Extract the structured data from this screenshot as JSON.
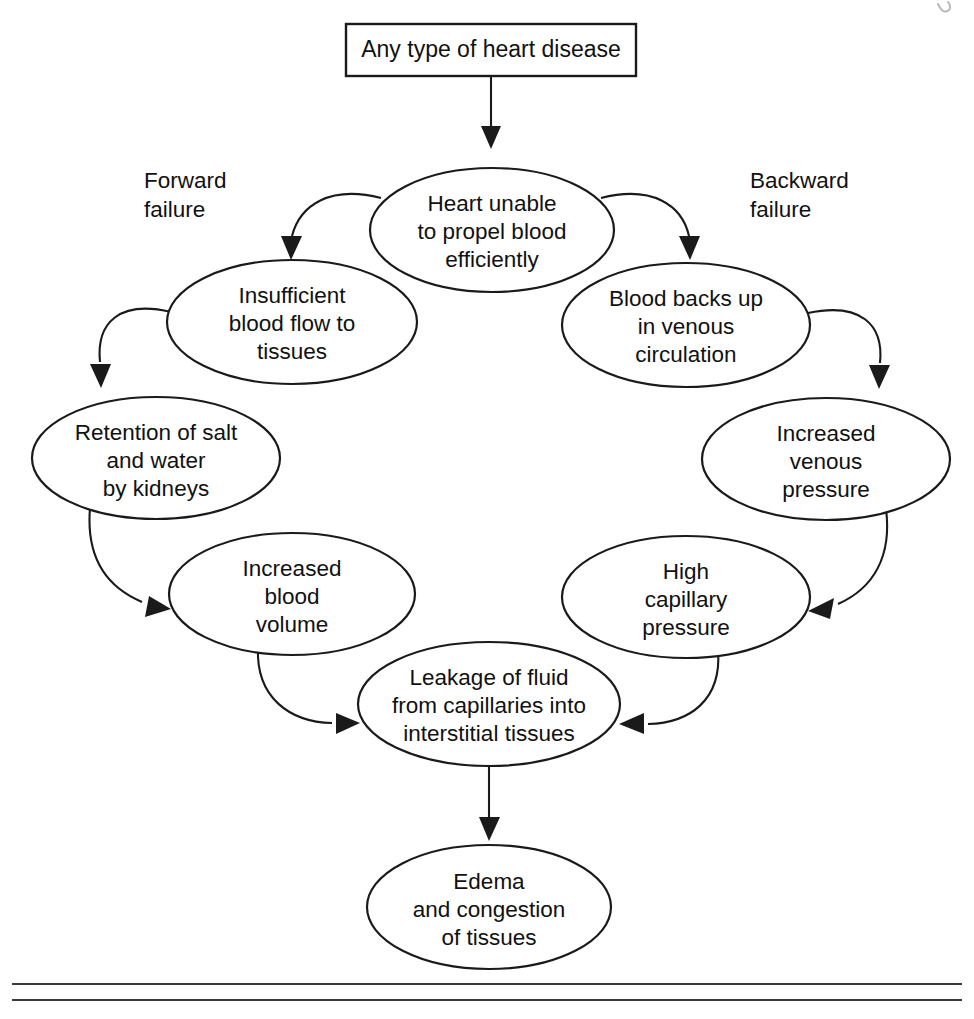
{
  "figure": {
    "kind": "flowchart",
    "title_box": {
      "label": "Any type of heart disease",
      "x": 346,
      "y": 24,
      "w": 290,
      "h": 52
    },
    "side_labels": [
      {
        "id": "forward-failure",
        "line1": "Forward",
        "line2": "failure",
        "x": 144,
        "y": 188
      },
      {
        "id": "backward-failure",
        "line1": "Backward",
        "line2": "failure",
        "x": 750,
        "y": 188
      }
    ],
    "nodes": [
      {
        "id": "heart-unable",
        "lines": [
          "Heart unable",
          "to propel blood",
          "efficiently"
        ],
        "cx": 492,
        "cy": 230,
        "rx": 122,
        "ry": 62
      },
      {
        "id": "insufficient-blood-flow",
        "lines": [
          "Insufficient",
          "blood flow to",
          "tissues"
        ],
        "cx": 292,
        "cy": 322,
        "rx": 125,
        "ry": 62
      },
      {
        "id": "blood-backs-up",
        "lines": [
          "Blood backs up",
          "in venous",
          "circulation"
        ],
        "cx": 686,
        "cy": 325,
        "rx": 124,
        "ry": 62
      },
      {
        "id": "retention-salt-water",
        "lines": [
          "Retention of salt",
          "and water",
          "by kidneys"
        ],
        "cx": 156,
        "cy": 458,
        "rx": 124,
        "ry": 61
      },
      {
        "id": "increased-venous-pressure",
        "lines": [
          "Increased",
          "venous",
          "pressure"
        ],
        "cx": 826,
        "cy": 459,
        "rx": 124,
        "ry": 61
      },
      {
        "id": "increased-blood-volume",
        "lines": [
          "Increased",
          "blood",
          "volume"
        ],
        "cx": 292,
        "cy": 594,
        "rx": 123,
        "ry": 61
      },
      {
        "id": "high-capillary-pressure",
        "lines": [
          "High",
          "capillary",
          "pressure"
        ],
        "cx": 686,
        "cy": 597,
        "rx": 124,
        "ry": 61
      },
      {
        "id": "leakage-of-fluid",
        "lines": [
          "Leakage of fluid",
          "from capillaries into",
          "interstitial tissues"
        ],
        "cx": 489,
        "cy": 704,
        "rx": 131,
        "ry": 62
      },
      {
        "id": "edema-congestion",
        "lines": [
          "Edema",
          "and congestion",
          "of tissues"
        ],
        "cx": 489,
        "cy": 907,
        "rx": 122,
        "ry": 62
      }
    ],
    "edges": [
      {
        "id": "edge-disease-to-heart",
        "from": "title-box",
        "to": "heart-unable",
        "style": "straight-vertical"
      },
      {
        "id": "edge-heart-to-insufficient",
        "from": "heart-unable",
        "to": "insufficient-blood-flow",
        "style": "curve-left"
      },
      {
        "id": "edge-heart-to-backs-up",
        "from": "heart-unable",
        "to": "blood-backs-up",
        "style": "curve-right"
      },
      {
        "id": "edge-insufficient-to-retention",
        "from": "insufficient-blood-flow",
        "to": "retention-salt-water",
        "style": "curve-left"
      },
      {
        "id": "edge-backsup-to-venous-pressure",
        "from": "blood-backs-up",
        "to": "increased-venous-pressure",
        "style": "curve-right"
      },
      {
        "id": "edge-retention-to-volume",
        "from": "retention-salt-water",
        "to": "increased-blood-volume",
        "style": "curve-down-right"
      },
      {
        "id": "edge-venous-to-capillary",
        "from": "increased-venous-pressure",
        "to": "high-capillary-pressure",
        "style": "curve-down-left"
      },
      {
        "id": "edge-volume-to-leakage",
        "from": "increased-blood-volume",
        "to": "leakage-of-fluid",
        "style": "curve-down-right"
      },
      {
        "id": "edge-capillary-to-leakage",
        "from": "high-capillary-pressure",
        "to": "leakage-of-fluid",
        "style": "curve-down-left"
      },
      {
        "id": "edge-leakage-to-edema",
        "from": "leakage-of-fluid",
        "to": "edema-congestion",
        "style": "straight-vertical"
      }
    ],
    "footer_rules": [
      {
        "id": "footer-rule-top",
        "y": 984
      },
      {
        "id": "footer-rule-bottom",
        "y": 1000
      }
    ],
    "colors": {
      "ink": "#1a1a1a",
      "paper": "#ffffff",
      "rule": "#3a3a3a"
    }
  }
}
